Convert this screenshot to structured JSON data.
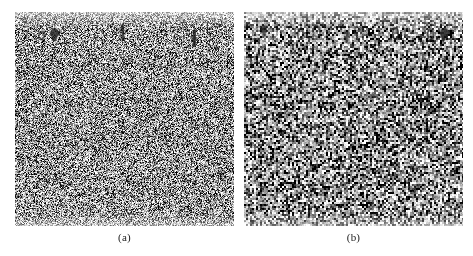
{
  "figure": {
    "background_color": "#ffffff",
    "panel_count": 2,
    "caption_style": "parenthesized-letter",
    "panels": [
      {
        "id": "a",
        "caption": "(a)",
        "description": "noisy grayscale image",
        "noise": {
          "type": "salt-and-pepper",
          "grain": "fine",
          "cell_size_px": 1,
          "mean_level": 0.62,
          "contrast": 0.95,
          "seed": 1337
        },
        "base_color": "#d2d2d2",
        "ink_color": "#1e1e1e",
        "marks": [
          {
            "name": "smudge-1",
            "x_pct": 10.5,
            "y_pct": 9.0,
            "w": 7,
            "h": 9,
            "shape": "oval",
            "angle": -6,
            "opacity": 0.62
          },
          {
            "name": "smudge-2",
            "x_pct": 15.5,
            "y_pct": 7.0,
            "w": 11,
            "h": 15,
            "shape": "blob",
            "angle": 4,
            "opacity": 0.8
          },
          {
            "name": "smudge-3",
            "x_pct": 47.5,
            "y_pct": 5.0,
            "w": 8,
            "h": 19,
            "shape": "vertical-streak",
            "angle": -3,
            "opacity": 0.82
          },
          {
            "name": "smudge-4",
            "x_pct": 80.0,
            "y_pct": 7.5,
            "w": 9,
            "h": 20,
            "shape": "vertical-streak",
            "angle": 2,
            "opacity": 0.86
          },
          {
            "name": "smudge-5",
            "x_pct": 93.0,
            "y_pct": 3.0,
            "w": 5,
            "h": 7,
            "shape": "tick",
            "angle": 10,
            "opacity": 0.45
          }
        ]
      },
      {
        "id": "b",
        "caption": "(b)",
        "description": "noisy grayscale image",
        "noise": {
          "type": "salt-and-pepper",
          "grain": "coarse",
          "cell_size_px": 2,
          "mean_level": 0.58,
          "contrast": 1.0,
          "seed": 90210
        },
        "base_color": "#c9c9c9",
        "ink_color": "#1a1a1a",
        "marks": [
          {
            "name": "smudge-1",
            "x_pct": 7.5,
            "y_pct": 5.5,
            "w": 8,
            "h": 13,
            "shape": "blob",
            "angle": -4,
            "opacity": 0.72
          },
          {
            "name": "smudge-2",
            "x_pct": 24.0,
            "y_pct": 7.5,
            "w": 7,
            "h": 12,
            "shape": "oval",
            "angle": 3,
            "opacity": 0.7
          },
          {
            "name": "smudge-3",
            "x_pct": 31.0,
            "y_pct": 6.0,
            "w": 9,
            "h": 13,
            "shape": "oval",
            "angle": -8,
            "opacity": 0.68
          },
          {
            "name": "smudge-4",
            "x_pct": 45.0,
            "y_pct": 8.0,
            "w": 8,
            "h": 15,
            "shape": "vertical-streak",
            "angle": 5,
            "opacity": 0.74
          },
          {
            "name": "smudge-5",
            "x_pct": 67.5,
            "y_pct": 7.0,
            "w": 7,
            "h": 13,
            "shape": "oval",
            "angle": 0,
            "opacity": 0.72
          },
          {
            "name": "smudge-6",
            "x_pct": 83.5,
            "y_pct": 7.5,
            "w": 7,
            "h": 13,
            "shape": "oval",
            "angle": -3,
            "opacity": 0.7
          },
          {
            "name": "smudge-7",
            "x_pct": 89.0,
            "y_pct": 6.5,
            "w": 10,
            "h": 16,
            "shape": "blob",
            "angle": 6,
            "opacity": 0.8
          }
        ]
      }
    ]
  }
}
